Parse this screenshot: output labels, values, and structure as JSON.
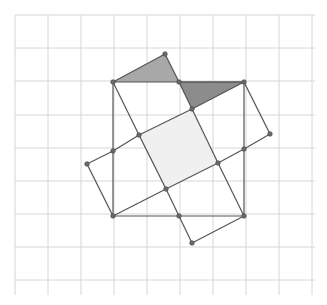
{
  "diagram": {
    "type": "geometric-construction",
    "grid": {
      "x0": 15,
      "y0": 15,
      "cell": 33,
      "cols": 9,
      "rows": 8,
      "x_extent": 315,
      "y_extent": 295,
      "line_color": "#d6d6d6"
    },
    "colors": {
      "edge": "#555555",
      "point": "#6a6a6a",
      "triangle_left_fill": "#a8a8a8",
      "triangle_right_fill": "#8c8c8c",
      "inner_square_fill": "#f0f0f0"
    },
    "points": {
      "T": [
        165,
        54
      ],
      "A": [
        113,
        82
      ],
      "M": [
        179,
        82
      ],
      "B": [
        244,
        82
      ],
      "P1": [
        192,
        109
      ],
      "Q1": [
        139,
        135
      ],
      "R": [
        270,
        134
      ],
      "L1": [
        113,
        151
      ],
      "R1": [
        244,
        149
      ],
      "S": [
        87,
        164
      ],
      "Q2": [
        218,
        163
      ],
      "Q3": [
        166,
        189
      ],
      "D": [
        113,
        216
      ],
      "N": [
        179,
        216
      ],
      "C": [
        244,
        216
      ],
      "U": [
        192,
        243
      ]
    },
    "shapes": {
      "big_square": [
        "A",
        "B",
        "C",
        "D"
      ],
      "triangle_left": [
        "A",
        "T",
        "M"
      ],
      "triangle_right": [
        "M",
        "B",
        "P1"
      ],
      "inner_square": [
        "P1",
        "Q2",
        "Q3",
        "Q1"
      ],
      "tilted_square": [
        "S",
        "T",
        "R",
        "U"
      ]
    },
    "segments": [
      [
        "A",
        "B"
      ],
      [
        "B",
        "C"
      ],
      [
        "C",
        "D"
      ],
      [
        "D",
        "A"
      ],
      [
        "A",
        "T"
      ],
      [
        "T",
        "M"
      ],
      [
        "M",
        "B"
      ],
      [
        "B",
        "P1"
      ],
      [
        "A",
        "Q1"
      ],
      [
        "Q1",
        "Q3"
      ],
      [
        "Q3",
        "N"
      ],
      [
        "N",
        "U"
      ],
      [
        "M",
        "P1"
      ],
      [
        "P1",
        "Q2"
      ],
      [
        "Q2",
        "C"
      ],
      [
        "B",
        "R"
      ],
      [
        "R",
        "R1"
      ],
      [
        "R1",
        "Q2"
      ],
      [
        "Q2",
        "Q3"
      ],
      [
        "Q3",
        "D"
      ],
      [
        "P1",
        "Q1"
      ],
      [
        "Q1",
        "L1"
      ],
      [
        "L1",
        "S"
      ],
      [
        "S",
        "D"
      ],
      [
        "U",
        "C"
      ]
    ],
    "labels": []
  }
}
